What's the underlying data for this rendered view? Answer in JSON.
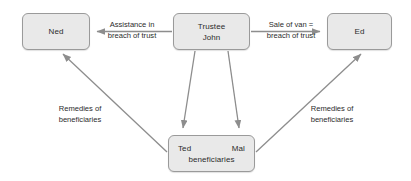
{
  "diagram": {
    "background_color": "#ffffff",
    "node_fill_color": "#e9e9e9",
    "node_border_color": "#9a9a9a",
    "arrow_color": "#8d8d8d",
    "text_color": "#2b2b2b",
    "nodes": {
      "ned": {
        "label": "Ned"
      },
      "trustee": {
        "line1": "Trustee",
        "line2": "John"
      },
      "ed": {
        "label": "Ed"
      },
      "beneficiaries": {
        "name1": "Ted",
        "name2": "Mal",
        "role": "beneficiaries"
      }
    },
    "edges": {
      "trustee_to_ned": {
        "line1": "Assistance in",
        "line2": "breach of trust"
      },
      "trustee_to_ed": {
        "line1": "Sale of van =",
        "line2": "breach of trust"
      },
      "beneficiaries_to_ned": {
        "line1": "Remedies of",
        "line2": "beneficiaries"
      },
      "beneficiaries_to_ed": {
        "line1": "Remedies of",
        "line2": "beneficiaries"
      }
    }
  }
}
